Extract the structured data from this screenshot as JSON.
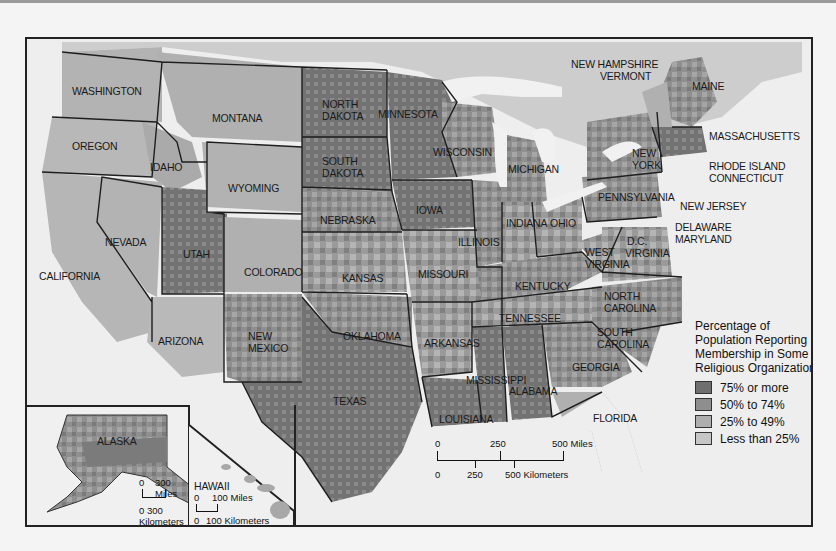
{
  "map": {
    "title": "Percentage of Population Reporting Membership in Some Religious Organization",
    "legend": {
      "title_lines": [
        "Percentage of",
        "Population Reporting",
        "Membership in Some",
        "Religious Organization"
      ],
      "items": [
        {
          "label": "75% or more",
          "color": "#6f6f6f"
        },
        {
          "label": "50% to 74%",
          "color": "#8e8e8e"
        },
        {
          "label": "25% to 49%",
          "color": "#aeaeae"
        },
        {
          "label": "Less than 25%",
          "color": "#c6c6c6"
        }
      ]
    },
    "colors": {
      "water": "#eeeeee",
      "land_outside": "#cfcfcf",
      "border": "#1e1e1e"
    },
    "state_labels": [
      {
        "name": "WASHINGTON",
        "x": 72,
        "y": 85
      },
      {
        "name": "OREGON",
        "x": 72,
        "y": 140
      },
      {
        "name": "IDAHO",
        "x": 150,
        "y": 161
      },
      {
        "name": "MONTANA",
        "x": 212,
        "y": 112
      },
      {
        "name": "WYOMING",
        "x": 228,
        "y": 182
      },
      {
        "name": "NORTH\nDAKOTA",
        "x": 322,
        "y": 98
      },
      {
        "name": "SOUTH\nDAKOTA",
        "x": 322,
        "y": 155
      },
      {
        "name": "MINNESOTA",
        "x": 378,
        "y": 108
      },
      {
        "name": "WISCONSIN",
        "x": 433,
        "y": 146
      },
      {
        "name": "MICHIGAN",
        "x": 508,
        "y": 163
      },
      {
        "name": "NEW\nYORK",
        "x": 632,
        "y": 147
      },
      {
        "name": "MAINE",
        "x": 692,
        "y": 80
      },
      {
        "name": "NEVADA",
        "x": 105,
        "y": 236
      },
      {
        "name": "UTAH",
        "x": 183,
        "y": 248
      },
      {
        "name": "COLORADO",
        "x": 244,
        "y": 266
      },
      {
        "name": "NEBRASKA",
        "x": 320,
        "y": 214
      },
      {
        "name": "IOWA",
        "x": 416,
        "y": 204
      },
      {
        "name": "ILLINOIS",
        "x": 458,
        "y": 236
      },
      {
        "name": "INDIANA",
        "x": 506,
        "y": 217
      },
      {
        "name": "OHIO",
        "x": 550,
        "y": 217
      },
      {
        "name": "PENNSYLVANIA",
        "x": 598,
        "y": 191
      },
      {
        "name": "CALIFORNIA",
        "x": 39,
        "y": 270
      },
      {
        "name": "KANSAS",
        "x": 342,
        "y": 272
      },
      {
        "name": "MISSOURI",
        "x": 418,
        "y": 268
      },
      {
        "name": "KENTUCKY",
        "x": 515,
        "y": 280
      },
      {
        "name": "WEST\nVIRGINIA",
        "x": 585,
        "y": 246
      },
      {
        "name": "VIRGINIA",
        "x": 625,
        "y": 247
      },
      {
        "name": "D.C.",
        "x": 627,
        "y": 235
      },
      {
        "name": "TENNESSEE",
        "x": 499,
        "y": 312
      },
      {
        "name": "NORTH\nCAROLINA",
        "x": 604,
        "y": 290
      },
      {
        "name": "SOUTH\nCAROLINA",
        "x": 597,
        "y": 326
      },
      {
        "name": "ARIZONA",
        "x": 158,
        "y": 335
      },
      {
        "name": "NEW\nMEXICO",
        "x": 248,
        "y": 330
      },
      {
        "name": "OKLAHOMA",
        "x": 343,
        "y": 330
      },
      {
        "name": "ARKANSAS",
        "x": 424,
        "y": 337
      },
      {
        "name": "MISSISSIPPI",
        "x": 466,
        "y": 374
      },
      {
        "name": "ALABAMA",
        "x": 509,
        "y": 385
      },
      {
        "name": "GEORGIA",
        "x": 572,
        "y": 361
      },
      {
        "name": "TEXAS",
        "x": 333,
        "y": 395
      },
      {
        "name": "LOUISIANA",
        "x": 439,
        "y": 413
      },
      {
        "name": "FLORIDA",
        "x": 593,
        "y": 412
      }
    ],
    "callout_labels": [
      {
        "name": "NEW HAMPSHIRE",
        "x": 571,
        "y": 58
      },
      {
        "name": "VERMONT",
        "x": 600,
        "y": 70
      },
      {
        "name": "MASSACHUSETTS",
        "x": 709,
        "y": 130
      },
      {
        "name": "RHODE ISLAND",
        "x": 709,
        "y": 160
      },
      {
        "name": "CONNECTICUT",
        "x": 709,
        "y": 172
      },
      {
        "name": "NEW JERSEY",
        "x": 680,
        "y": 200
      },
      {
        "name": "DELAWARE",
        "x": 675,
        "y": 221
      },
      {
        "name": "MARYLAND",
        "x": 675,
        "y": 233
      }
    ],
    "scale_bar": {
      "miles_ticks": [
        "0",
        "250",
        "500 Miles"
      ],
      "km_ticks": [
        "0",
        "250",
        "500 Kilometers"
      ]
    },
    "insets": {
      "alaska": {
        "label": "ALASKA",
        "miles": [
          "0",
          "300 Miles"
        ],
        "km": "0 300 Kilometers"
      },
      "hawaii": {
        "label": "HAWAII",
        "miles": [
          "0",
          "100 Miles"
        ],
        "km": [
          "0",
          "100 Kilometers"
        ]
      }
    }
  }
}
